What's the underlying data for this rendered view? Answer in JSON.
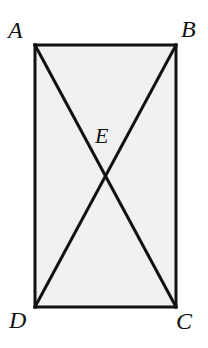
{
  "figure": {
    "kind": "geometry-diagram",
    "canvas": {
      "width": 208,
      "height": 348
    },
    "colors": {
      "background": "#ffffff",
      "interior_fill": "#f1f1f1",
      "stroke": "#111111",
      "label": "#111111"
    },
    "stroke_width": 3,
    "rectangle": {
      "name": "ABCD",
      "x": 35,
      "y": 45,
      "width": 141,
      "height": 262
    },
    "vertices": [
      {
        "id": "A",
        "label": "A",
        "x": 35,
        "y": 45,
        "label_position": "top-left-outside"
      },
      {
        "id": "B",
        "label": "B",
        "x": 176,
        "y": 45,
        "label_position": "top-right-outside"
      },
      {
        "id": "C",
        "label": "C",
        "x": 176,
        "y": 307,
        "label_position": "bottom-right-outside"
      },
      {
        "id": "D",
        "label": "D",
        "x": 35,
        "y": 307,
        "label_position": "bottom-left-outside"
      },
      {
        "id": "E",
        "label": "E",
        "x": 105,
        "y": 176,
        "label_position": "above-intersection"
      }
    ],
    "edges": [
      {
        "id": "AB",
        "from": "A",
        "to": "B"
      },
      {
        "id": "BC",
        "from": "B",
        "to": "C"
      },
      {
        "id": "CD",
        "from": "C",
        "to": "D"
      },
      {
        "id": "DA",
        "from": "D",
        "to": "A"
      }
    ],
    "diagonals": [
      {
        "id": "AC",
        "from": "A",
        "to": "C"
      },
      {
        "id": "BD",
        "from": "B",
        "to": "D"
      }
    ],
    "intersection": {
      "id": "E",
      "label": "E",
      "x": 105,
      "y": 176
    }
  }
}
